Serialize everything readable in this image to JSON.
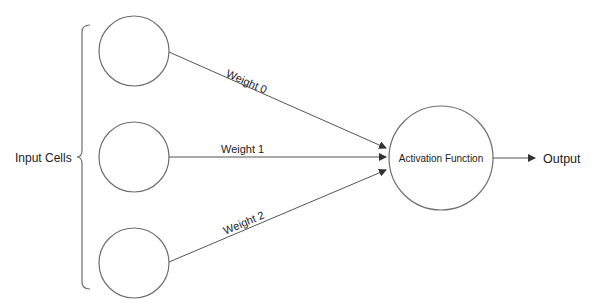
{
  "diagram": {
    "input_group_label": "Input Cells",
    "inputs": [
      {
        "id": "input-0",
        "cx": 134,
        "cy": 51,
        "r": 35
      },
      {
        "id": "input-1",
        "cx": 134,
        "cy": 157,
        "r": 35
      },
      {
        "id": "input-2",
        "cx": 134,
        "cy": 263,
        "r": 35
      }
    ],
    "weights": [
      {
        "label": "Weight 0",
        "from": "input-0"
      },
      {
        "label": "Weight 1",
        "from": "input-1"
      },
      {
        "label": "Weight 2",
        "from": "input-2"
      }
    ],
    "activation": {
      "label": "Activation Function",
      "cx": 441,
      "cy": 158,
      "r": 52
    },
    "output_label": "Output",
    "colors": {
      "stroke": "#6e6e6e",
      "arrow": "#333333",
      "text": "#222222"
    }
  }
}
